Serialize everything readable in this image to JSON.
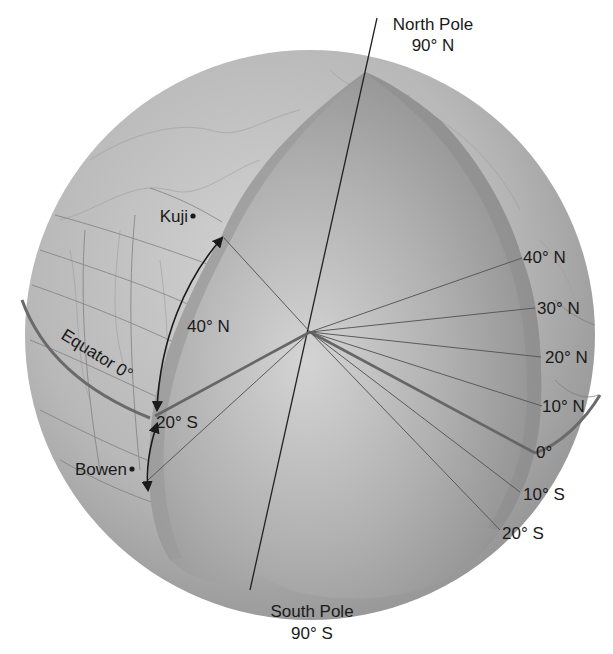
{
  "figure": {
    "colors": {
      "background": "#ffffff",
      "globe_surface": "#b8b8b8",
      "globe_shadow": "#8f8f8f",
      "cut_face": "#9a9a9a",
      "cut_face_light": "#cdcdcd",
      "line": "#555555",
      "text": "#1a1a1a"
    }
  },
  "poles": {
    "north": {
      "name": "North Pole",
      "value": "90° N"
    },
    "south": {
      "name": "South Pole",
      "value": "90° S"
    }
  },
  "equator_label": "Equator 0°",
  "cities": [
    {
      "name": "Kuji"
    },
    {
      "name": "Bowen"
    }
  ],
  "arc_labels": {
    "north": "40° N",
    "south": "20° S"
  },
  "latitude_labels": [
    {
      "label": "40° N"
    },
    {
      "label": "30° N"
    },
    {
      "label": "20° N"
    },
    {
      "label": "10° N"
    },
    {
      "label": "0°"
    },
    {
      "label": "10° S"
    },
    {
      "label": "20° S"
    }
  ]
}
